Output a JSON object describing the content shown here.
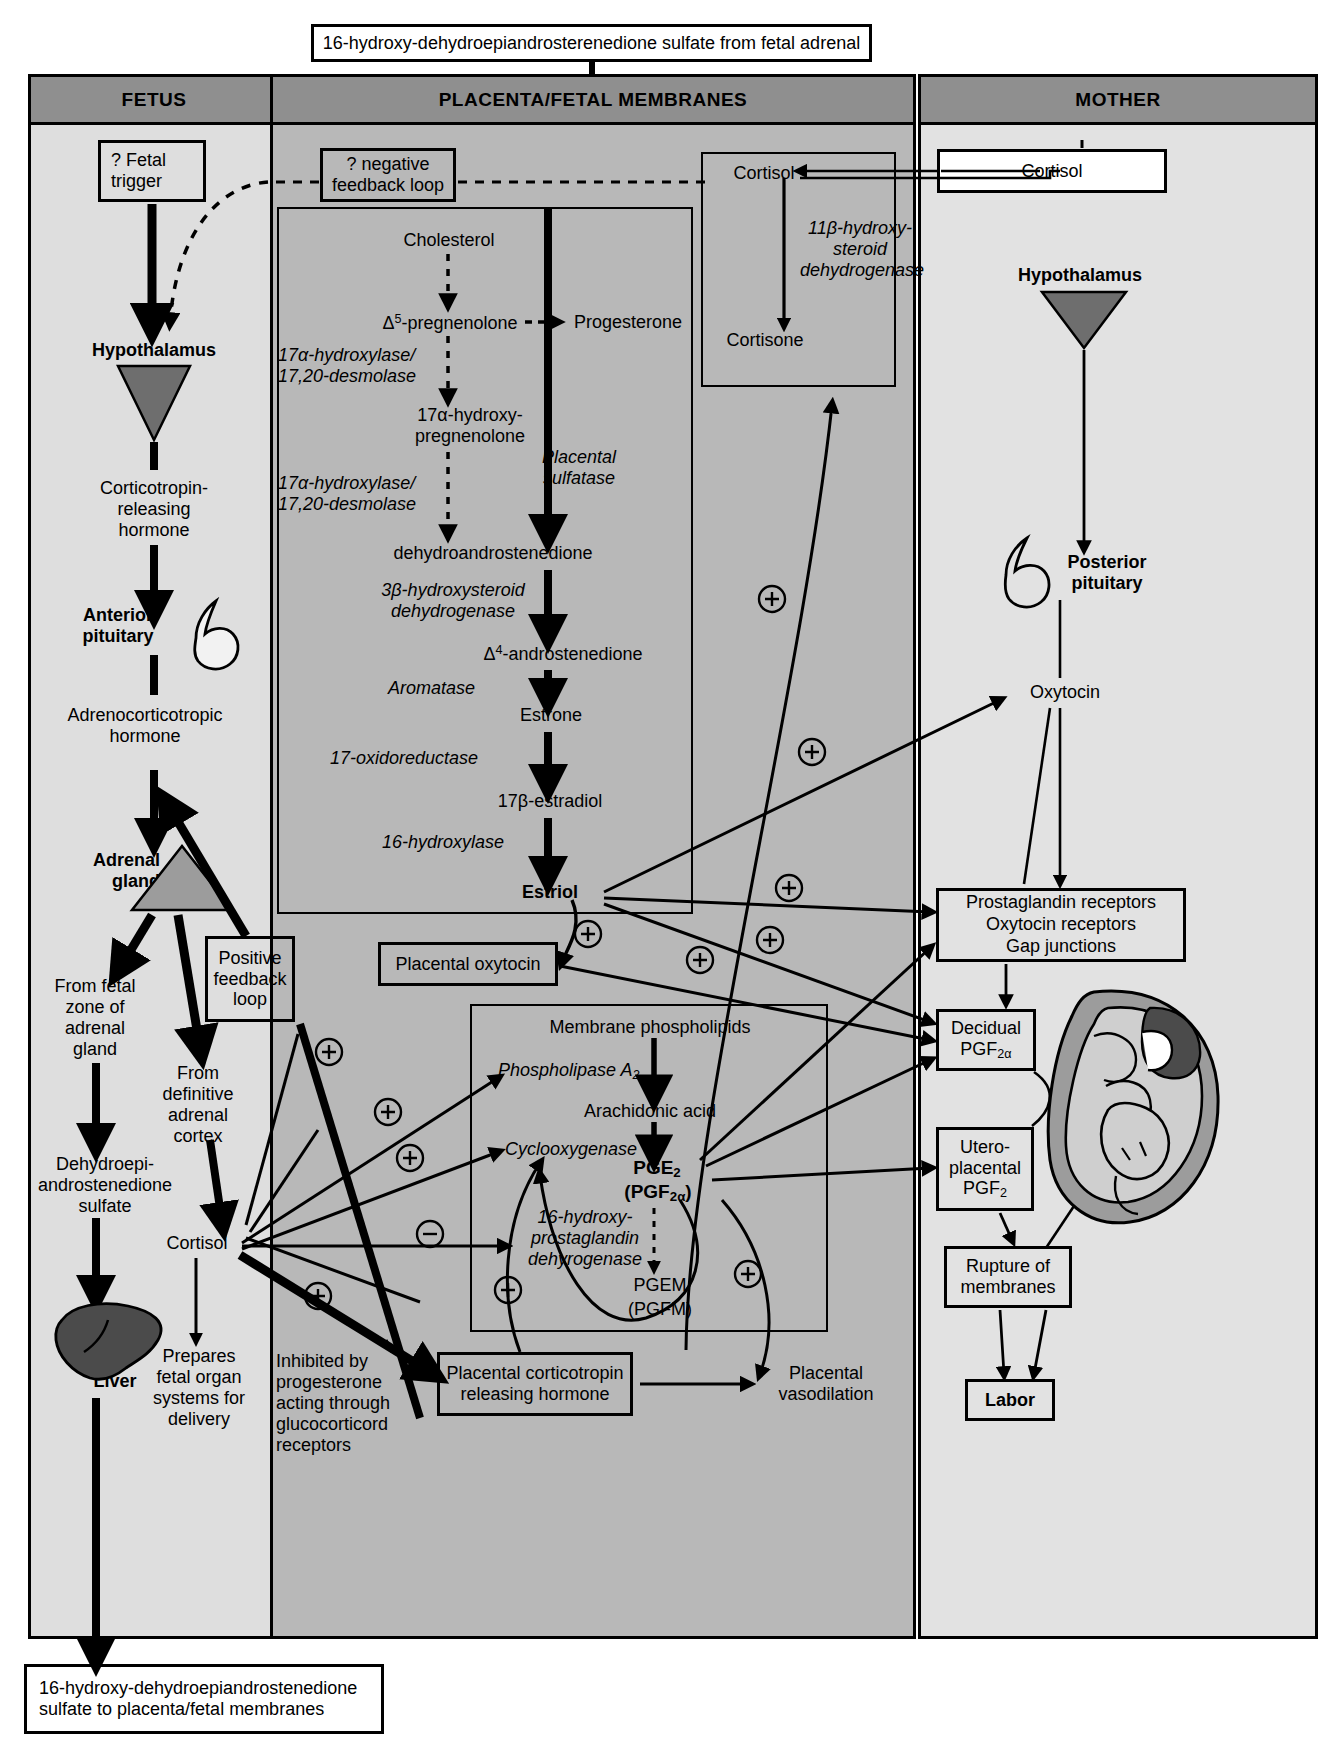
{
  "title_box": "16-hydroxy-dehydroepiandrosterenedione sulfate from fetal adrenal",
  "columns": {
    "fetus": "FETUS",
    "placenta": "PLACENTA/FETAL MEMBRANES",
    "mother": "MOTHER"
  },
  "fetus": {
    "fetal_trigger": "? Fetal\ntrigger",
    "hypothalamus": "Hypothalamus",
    "crh": "Corticotropin-\nreleasing\nhormone",
    "anterior_pituitary": "Anterior\npituitary",
    "acth": "Adrenocorticotropic\nhormone",
    "adrenal_gland": "Adrenal\ngland",
    "fetal_zone": "From fetal\nzone of\nadrenal\ngland",
    "definitive_cortex": "From\ndefinitive\nadrenal\ncortex",
    "dheas": "Dehydroepi-\nandrostenedione\nsulfate",
    "cortisol": "Cortisol",
    "liver": "Liver",
    "prepares": "Prepares\nfetal organ\nsystems for\ndelivery",
    "bottom_box": "16-hydroxy-dehydroepiandrostenedione\nsulfate to placenta/fetal membranes"
  },
  "placenta": {
    "negative_feedback": "? negative\nfeedback loop",
    "positive_feedback": "Positive\nfeedback\nloop",
    "inhibited_by": "Inhibited by\nprogesterone\nacting through\nglucocorticord\nreceptors",
    "steroid_pathway": {
      "cholesterol": "Cholesterol",
      "d5_pregnenolone": "Δ5-pregnenolone",
      "progesterone": "Progesterone",
      "enzyme_1": "17α-hydroxylase/\n17,20-desmolase",
      "hydroxy_pregnenolone": "17α-hydroxy-\npregnenolone",
      "enzyme_2": "17α-hydroxylase/\n17,20-desmolase",
      "placental_sulfatase": "Placental\nsulfatase",
      "dhea": "dehydroandrostenedione",
      "enzyme_3": "3β-hydroxysteroid\ndehydrogenase",
      "d4_androstenedione": "Δ4-androstenedione",
      "aromatase": "Aromatase",
      "estrone": "Estrone",
      "oxidoreductase": "17-oxidoreductase",
      "estradiol": "17β-estradiol",
      "hydroxylase16": "16-hydroxylase",
      "estriol": "Estriol"
    },
    "cortisol_box": {
      "cortisol": "Cortisol",
      "enzyme": "11β-hydroxy-\nsteroid\ndehydrogenase",
      "cortisone": "Cortisone"
    },
    "placental_oxytocin": "Placental oxytocin",
    "prostaglandin_pathway": {
      "membrane_phospholipids": "Membrane phospholipids",
      "phospholipase": "Phospholipase A2",
      "arachidonic_acid": "Arachidonic acid",
      "cyclooxygenase": "Cyclooxygenase",
      "pge2": "PGE2",
      "pgf2a": "(PGF2α)",
      "dehydrogenase16": "16-hydroxy-\nprostaglandin\ndehyrogenase",
      "pgem": "PGEM",
      "pgfm": "(PGFM)"
    },
    "crh_box": "Placental corticotropin\nreleasing hormone",
    "vasodilation": "Placental\nvasodilation"
  },
  "mother": {
    "cortisol": "Cortisol",
    "hypothalamus": "Hypothalamus",
    "posterior_pituitary": "Posterior\npituitary",
    "oxytocin": "Oxytocin",
    "receptors": "Prostaglandin receptors\nOxytocin receptors\nGap junctions",
    "decidual": "Decidual\nPGF2α",
    "uteroplacental": "Utero-\nplacental\nPGF2",
    "uterus": "Uterus",
    "rupture": "Rupture of\nmembranes",
    "labor": "Labor"
  },
  "signs": {
    "plus": "⊕",
    "minus": "⊖"
  },
  "colors": {
    "header_gray": "#8f8f8f",
    "fetus_bg": "#dedede",
    "placenta_bg": "#b8b8b8",
    "mother_bg": "#e2e2e2",
    "organ_dark": "#6e6e6e",
    "liver_dark": "#4b4b4b",
    "stroke": "#000000"
  }
}
